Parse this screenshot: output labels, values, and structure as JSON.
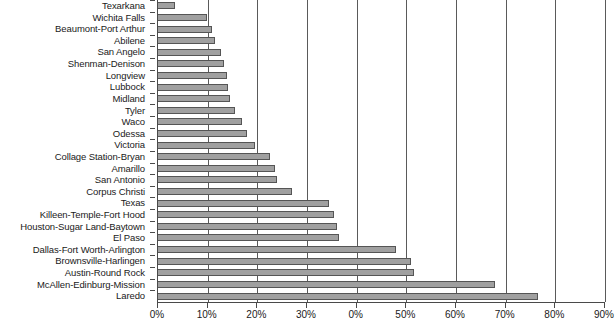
{
  "chart_data": {
    "type": "bar",
    "orientation": "horizontal",
    "title": "",
    "xlabel": "",
    "ylabel": "",
    "xlim": [
      0,
      90
    ],
    "grid": true,
    "legend": false,
    "xtick_values": [
      0,
      10,
      20,
      30,
      40,
      50,
      60,
      70,
      80,
      90
    ],
    "xtick_labels": [
      "0%",
      "10%",
      "20%",
      "30%",
      "0%",
      "50%",
      "60%",
      "70%",
      "80%",
      "90%"
    ],
    "categories": [
      "Texarkana",
      "Wichita Falls",
      "Beaumont-Port Arthur",
      "Abilene",
      "San Angelo",
      "Shenman-Denison",
      "Longview",
      "Lubbock",
      "Midland",
      "Tyler",
      "Waco",
      "Odessa",
      "Victoria",
      "Collage Station-Bryan",
      "Amarillo",
      "San Antonio",
      "Corpus Christi",
      "Texas",
      "Killeen-Temple-Fort Hood",
      "Houston-Sugar Land-Baytown",
      "El Paso",
      "Dallas-Fort Worth-Arlington",
      "Brownsville-Harlingen",
      "Austin-Round Rock",
      "McAllen-Edinburg-Mission",
      "Laredo"
    ],
    "values": [
      3.5,
      9.8,
      10.8,
      11.5,
      12.7,
      13.2,
      13.8,
      14.0,
      14.5,
      15.5,
      17.0,
      18.0,
      19.5,
      22.5,
      23.5,
      24.0,
      27.0,
      34.5,
      35.5,
      36.0,
      36.5,
      48.0,
      51.0,
      51.5,
      67.8,
      76.5
    ],
    "bar_color": "#a0a0a0",
    "bar_edge_color": "#555555",
    "axis_color": "#4a4a4a",
    "gridline_color": "#5a5a5a",
    "background_color": "#ffffff"
  }
}
